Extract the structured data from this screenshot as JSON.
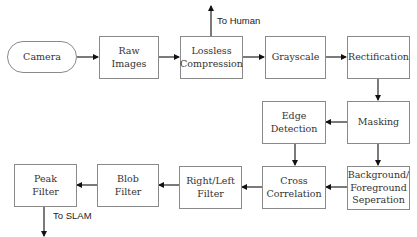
{
  "diagram": {
    "type": "flowchart",
    "nodes": [
      {
        "id": "camera",
        "label": "Camera",
        "shape": "rounded"
      },
      {
        "id": "raw",
        "label": "Raw\nImages",
        "shape": "rect"
      },
      {
        "id": "lossless",
        "label": "Lossless\nCompression",
        "shape": "rect"
      },
      {
        "id": "grayscale",
        "label": "Grayscale",
        "shape": "rect"
      },
      {
        "id": "rectification",
        "label": "Rectification",
        "shape": "rect"
      },
      {
        "id": "masking",
        "label": "Masking",
        "shape": "rect"
      },
      {
        "id": "edge",
        "label": "Edge\nDetection",
        "shape": "rect"
      },
      {
        "id": "bgfg",
        "label": "Background/\nForeground\nSeperation",
        "shape": "rect"
      },
      {
        "id": "cross",
        "label": "Cross\nCorrelation",
        "shape": "rect"
      },
      {
        "id": "rightleft",
        "label": "Right/Left\nFilter",
        "shape": "rect"
      },
      {
        "id": "blob",
        "label": "Blob\nFilter",
        "shape": "rect"
      },
      {
        "id": "peak",
        "label": "Peak\nFilter",
        "shape": "rect"
      }
    ],
    "edges": [
      {
        "from": "camera",
        "to": "raw"
      },
      {
        "from": "raw",
        "to": "lossless"
      },
      {
        "from": "lossless",
        "to": "to_human",
        "label": "To Human"
      },
      {
        "from": "lossless",
        "to": "grayscale"
      },
      {
        "from": "grayscale",
        "to": "rectification"
      },
      {
        "from": "rectification",
        "to": "masking"
      },
      {
        "from": "masking",
        "to": "edge"
      },
      {
        "from": "masking",
        "to": "bgfg"
      },
      {
        "from": "edge",
        "to": "cross"
      },
      {
        "from": "bgfg",
        "to": "cross"
      },
      {
        "from": "cross",
        "to": "rightleft"
      },
      {
        "from": "rightleft",
        "to": "blob"
      },
      {
        "from": "blob",
        "to": "peak"
      },
      {
        "from": "peak",
        "to": "to_slam",
        "label": "To SLAM"
      }
    ],
    "outputs": {
      "to_human": "To Human",
      "to_slam": "To SLAM"
    },
    "colors": {
      "box_border": "#8a8a8a",
      "arrow": "#111111",
      "text": "#333333"
    }
  }
}
